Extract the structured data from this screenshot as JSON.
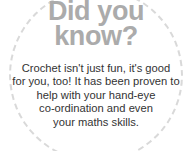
{
  "card": {
    "title": "Did you\nknow?",
    "title_lines": [
      "Did you",
      "know?"
    ],
    "body_lines": [
      "Crochet isn't just fun, it's good",
      "for you, too! It has been proven to",
      "help with your hand-eye",
      "co-ordination and even",
      "your maths skills."
    ],
    "body_text": "Crochet isn't just fun, it's good for you, too! It has been proven to help with your hand-eye co-ordination and even your maths skills.",
    "colors": {
      "background": "#ffffff",
      "title": "#ababab",
      "body": "#333333",
      "dashed_border": "#d9d9d9"
    }
  }
}
